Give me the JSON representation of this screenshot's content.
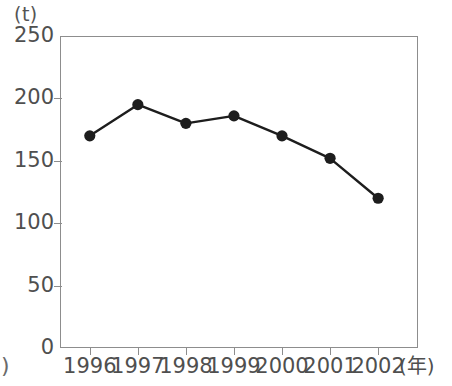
{
  "figure": {
    "y_unit_label": "(t)",
    "x_unit_label": "(年)",
    "left_margin_artifact": ")"
  },
  "chart_data": {
    "type": "line",
    "title": "",
    "subtitle": "",
    "xlabel": "(年)",
    "ylabel": "(t)",
    "categories": [
      "1996",
      "1997",
      "1998",
      "1999",
      "2000",
      "2001",
      "2002"
    ],
    "values": [
      170,
      195,
      180,
      186,
      170,
      152,
      120
    ],
    "series": [
      {
        "name": "",
        "values": [
          170,
          195,
          180,
          186,
          170,
          152,
          120
        ]
      }
    ],
    "ylim": [
      0,
      250
    ],
    "yticks": [
      0,
      50,
      100,
      150,
      200,
      250
    ],
    "ytick_labels": [
      "0",
      "50",
      "100",
      "150",
      "200",
      "250"
    ],
    "xtick_labels": [
      "1996",
      "1997",
      "1998",
      "1999",
      "2000",
      "2001",
      "2002"
    ],
    "grid": false,
    "legend": false,
    "legend_position": "none",
    "marker": "filled-circle",
    "line_color": "#1d1d1d",
    "marker_color": "#1d1d1d",
    "axis_color": "#8d8d8d",
    "background_color": "#ffffff",
    "annotations": []
  }
}
